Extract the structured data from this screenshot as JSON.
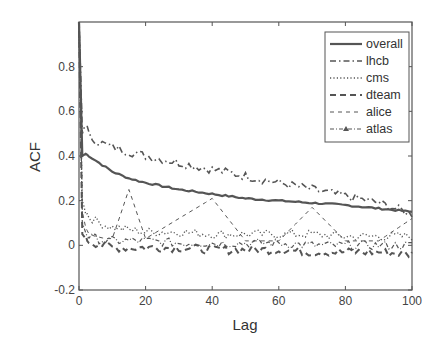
{
  "chart_data": {
    "type": "line",
    "title": "",
    "xlabel": "Lag",
    "ylabel": "ACF",
    "xlim": [
      0,
      100
    ],
    "ylim": [
      -0.2,
      1.0
    ],
    "xticks": [
      0,
      20,
      40,
      60,
      80,
      100
    ],
    "yticks": [
      -0.2,
      0,
      0.2,
      0.4,
      0.6,
      0.8
    ],
    "ytick_labels": [
      "-0.2",
      "0",
      "0.2",
      "0.4",
      "0.6",
      "0.8"
    ],
    "xtick_labels": [
      "0",
      "20",
      "40",
      "60",
      "80",
      "100"
    ],
    "grid": false,
    "legend_position": "upper right",
    "x": [
      0,
      1,
      2,
      3,
      5,
      8,
      10,
      15,
      20,
      30,
      40,
      50,
      60,
      70,
      80,
      90,
      100
    ],
    "series": [
      {
        "name": "overall",
        "style": "solid",
        "values": [
          1.0,
          0.4,
          0.41,
          0.4,
          0.38,
          0.35,
          0.33,
          0.3,
          0.28,
          0.25,
          0.23,
          0.21,
          0.2,
          0.19,
          0.18,
          0.165,
          0.15
        ]
      },
      {
        "name": "lhcb",
        "style": "dashdot",
        "values": [
          1.0,
          0.5,
          0.55,
          0.49,
          0.47,
          0.45,
          0.44,
          0.42,
          0.4,
          0.37,
          0.34,
          0.31,
          0.28,
          0.25,
          0.22,
          0.19,
          0.14
        ]
      },
      {
        "name": "cms",
        "style": "dotted",
        "values": [
          1.0,
          0.2,
          0.15,
          0.13,
          0.11,
          0.09,
          0.08,
          0.07,
          0.06,
          0.06,
          0.05,
          0.05,
          0.05,
          0.05,
          0.04,
          0.04,
          0.04
        ]
      },
      {
        "name": "dteam",
        "style": "dashed",
        "values": [
          1.0,
          0.05,
          0.03,
          0.02,
          0.01,
          0.0,
          -0.01,
          -0.01,
          -0.01,
          -0.01,
          -0.02,
          -0.02,
          -0.02,
          -0.03,
          -0.03,
          -0.03,
          -0.04
        ]
      },
      {
        "name": "alice",
        "style": "dashed-thin",
        "values": [
          1.0,
          0.15,
          0.08,
          0.05,
          0.04,
          0.03,
          0.03,
          0.25,
          0.03,
          0.12,
          0.21,
          0.02,
          0.02,
          0.17,
          0.02,
          0.02,
          0.12
        ]
      },
      {
        "name": "atlas",
        "style": "dashdot-triangle",
        "values": [
          1.0,
          0.1,
          0.06,
          0.04,
          0.03,
          0.02,
          0.02,
          0.02,
          0.02,
          0.01,
          0.01,
          0.01,
          0.01,
          0.0,
          0.0,
          0.0,
          0.0
        ]
      }
    ],
    "annotations": []
  },
  "legend": {
    "items": [
      "overall",
      "lhcb",
      "cms",
      "dteam",
      "alice",
      "atlas"
    ]
  },
  "colors": {
    "axes": "#555555",
    "line": "#555555",
    "background": "#ffffff"
  }
}
